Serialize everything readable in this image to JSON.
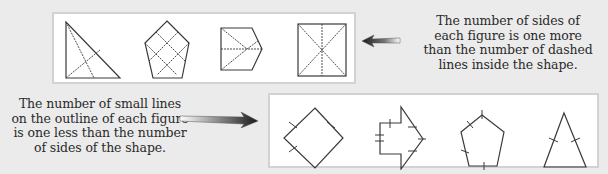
{
  "top_panel": {
    "description": "Four shapes with dashed interior lines",
    "figures": [
      {
        "shape": "right-triangle",
        "sides": 3,
        "dashed_lines": 2
      },
      {
        "shape": "pentagon",
        "sides": 5,
        "dashed_lines": 4
      },
      {
        "shape": "house-pentagon",
        "sides": 5,
        "dashed_lines": 4
      },
      {
        "shape": "square",
        "sides": 4,
        "dashed_lines": 3
      }
    ]
  },
  "top_caption": {
    "lines": [
      "The number of sides of",
      "each figure is one more",
      "than the number of dashed",
      "lines inside the shape."
    ]
  },
  "bottom_panel": {
    "description": "Four shapes with small tick lines on their outlines",
    "figures": [
      {
        "shape": "diamond",
        "sides": 4,
        "ticks": 3
      },
      {
        "shape": "arrow-polygon",
        "sides": 7,
        "ticks": 6
      },
      {
        "shape": "pentagon",
        "sides": 5,
        "ticks": 4
      },
      {
        "shape": "isosceles-triangle",
        "sides": 3,
        "ticks": 2
      }
    ]
  },
  "bottom_caption": {
    "lines": [
      "The number of small lines",
      "on the outline of each figure",
      "is one less than the number",
      "of sides of the shape."
    ]
  },
  "arrows": {
    "top": {
      "direction": "left",
      "icon": "arrow-left-icon"
    },
    "bottom": {
      "direction": "right",
      "icon": "arrow-right-icon"
    }
  },
  "colors": {
    "background": "#ebebeb",
    "panel": "#ffffff",
    "panel_border": "#d2d2d2",
    "stroke": "#3a3a3a",
    "text": "#2a2a2a"
  }
}
